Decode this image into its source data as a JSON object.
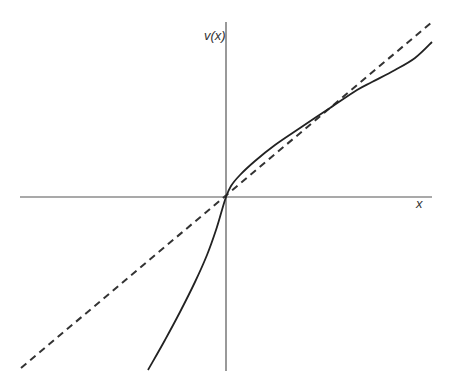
{
  "chart_data": {
    "type": "line",
    "title": "",
    "xlabel": "x",
    "ylabel": "v(x)",
    "grid": false,
    "legend": null,
    "axes": {
      "origin_px": [
        226,
        197
      ],
      "x_axis_px": [
        20,
        432
      ],
      "y_axis_px": [
        22,
        371
      ],
      "ticks": "none"
    },
    "series": [
      {
        "name": "v(x)",
        "style": "solid",
        "color": "#222222",
        "description": "Curve with vertical tangent at origin; concave for x>0, convex for x<0; crosses identity line again at upper right",
        "points_px": [
          [
            148,
            370
          ],
          [
            165,
            340
          ],
          [
            180,
            312
          ],
          [
            195,
            282
          ],
          [
            207,
            255
          ],
          [
            216,
            230
          ],
          [
            222,
            210
          ],
          [
            226,
            197
          ],
          [
            231,
            186
          ],
          [
            240,
            175
          ],
          [
            255,
            161
          ],
          [
            275,
            145
          ],
          [
            300,
            128
          ],
          [
            330,
            108
          ],
          [
            357,
            90
          ],
          [
            372,
            82
          ],
          [
            395,
            70
          ],
          [
            415,
            58
          ],
          [
            432,
            42
          ]
        ]
      },
      {
        "name": "identity (v = x)",
        "style": "dashed",
        "color": "#222222",
        "points_px": [
          [
            21,
            368
          ],
          [
            432,
            22
          ]
        ]
      }
    ]
  },
  "labels": {
    "y_axis": "v(x)",
    "x_axis": "x"
  },
  "colors": {
    "background": "#ffffff",
    "axis": "#555555",
    "curve": "#222222"
  }
}
